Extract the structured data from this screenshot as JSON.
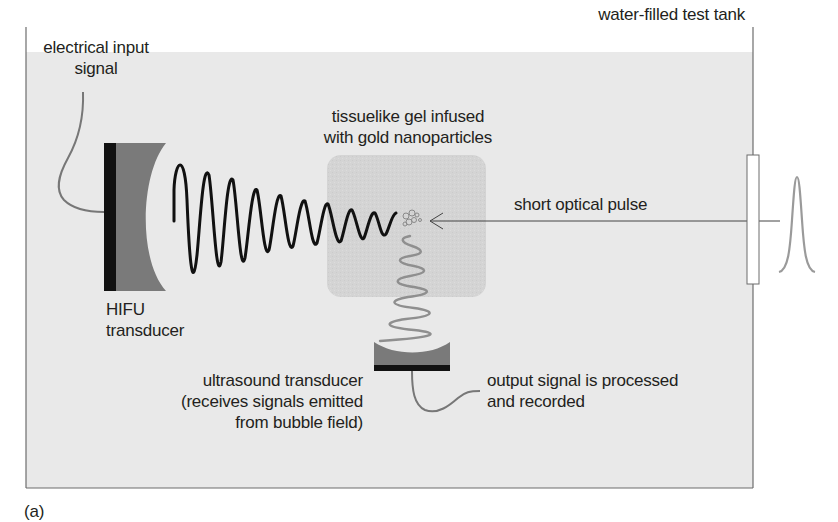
{
  "figure": {
    "panel_label": "(a)",
    "colors": {
      "tank_fill": "#e9e9e9",
      "tank_border": "#6d6d6d",
      "gel_fill": "#d5d5d5",
      "hifu_backing": "#111111",
      "hifu_lens": "#7a7a7a",
      "hifu_wave": "#111111",
      "emitted_wave": "#8f8f8f",
      "cable": "#777777",
      "pulse": "#9a9a9a",
      "text": "#231f20"
    }
  },
  "labels": {
    "tank": "water-filled test tank",
    "electrical_input_line1": "electrical input",
    "electrical_input_line2": "signal",
    "gel_line1": "tissuelike gel infused",
    "gel_line2": "with gold nanoparticles",
    "optical_pulse": "short optical pulse",
    "hifu_line1": "HIFU",
    "hifu_line2": "transducer",
    "ultrasound_line1": "ultrasound transducer",
    "ultrasound_line2": "(receives signals emitted",
    "ultrasound_line3": "from bubble field)",
    "output_line1": "output signal is processed",
    "output_line2": "and recorded"
  },
  "components": [
    {
      "id": "water-tank",
      "name": "water-filled test tank"
    },
    {
      "id": "hifu-transducer",
      "name": "HIFU transducer"
    },
    {
      "id": "gel-sample",
      "name": "tissuelike gel infused with gold nanoparticles"
    },
    {
      "id": "bubble-field",
      "name": "bubble field"
    },
    {
      "id": "ultrasound-transducer",
      "name": "ultrasound transducer"
    },
    {
      "id": "optical-window",
      "name": "optical window"
    },
    {
      "id": "optical-pulse",
      "name": "short optical pulse"
    }
  ]
}
